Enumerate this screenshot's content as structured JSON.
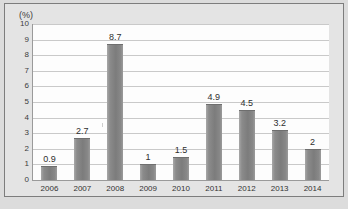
{
  "figure": {
    "axis_unit_label": "(%)",
    "background_color": "#dcdcdc",
    "plot_background_color": "#fdfdfd",
    "bar_color": "#7c7c7c",
    "gridline_color": "#c9c9c9",
    "axis_color": "#9a9a9a"
  },
  "chart_data": {
    "type": "bar",
    "title": "",
    "xlabel": "",
    "ylabel": "(%)",
    "ylim": [
      0,
      10
    ],
    "yticks": [
      0,
      1,
      2,
      3,
      4,
      5,
      6,
      7,
      8,
      9,
      10
    ],
    "ytick_labels": [
      "0",
      "1",
      "2",
      "3",
      "4",
      "5",
      "6",
      "7",
      "8",
      "9",
      "10"
    ],
    "grid": true,
    "legend": false,
    "categories": [
      "2006",
      "2007",
      "2008",
      "2009",
      "2010",
      "2011",
      "2012",
      "2013",
      "2014"
    ],
    "values": [
      0.9,
      2.7,
      8.7,
      1,
      1.5,
      4.9,
      4.5,
      3.2,
      2
    ],
    "data_labels": [
      "0.9",
      "2.7",
      "8.7",
      "1",
      "1.5",
      "4.9",
      "4.5",
      "3.2",
      "2"
    ]
  }
}
